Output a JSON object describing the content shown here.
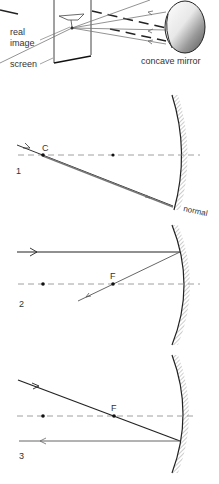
{
  "top_figure": {
    "labels": {
      "real": "real",
      "image": "image",
      "screen": "screen",
      "mirror": "concave mirror"
    }
  },
  "figure1": {
    "number": "1",
    "point_c": "C",
    "normal_label": "normal"
  },
  "figure2": {
    "number": "2",
    "point_f": "F"
  },
  "figure3": {
    "number": "3",
    "point_f": "F"
  },
  "colors": {
    "ink": "#222222",
    "ray_gray": "#666666",
    "axis": "#888888",
    "hatch": "#999999"
  }
}
